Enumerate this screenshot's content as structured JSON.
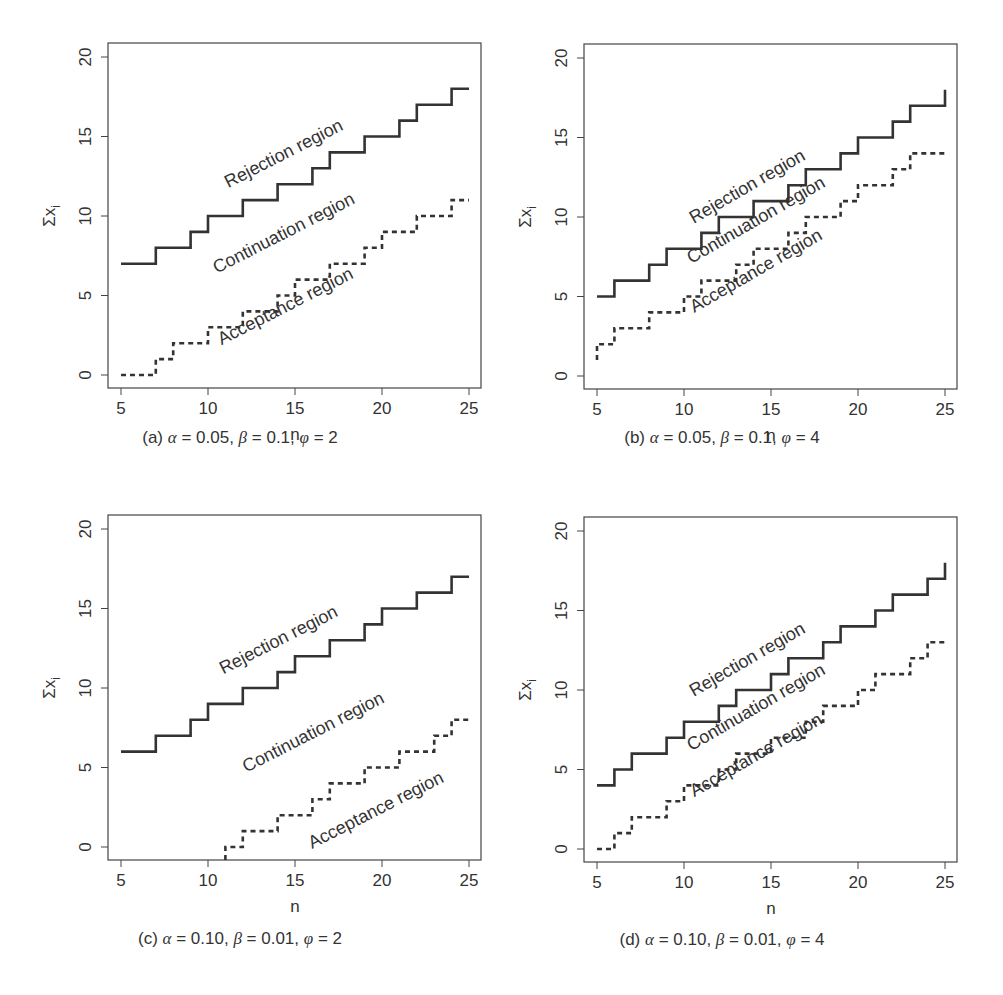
{
  "chart_data": [
    {
      "type": "line",
      "id": "a",
      "title": "",
      "caption": "(a) α = 0.05, β = 0.1, φ = 2",
      "xlabel": "n",
      "ylabel": "Σx_i",
      "xlim": [
        5,
        25
      ],
      "ylim": [
        0,
        20
      ],
      "xticks": [
        5,
        10,
        15,
        20,
        25
      ],
      "yticks": [
        0,
        5,
        10,
        15,
        20
      ],
      "grid": false,
      "annotations": [
        "Rejection region",
        "Continuation region",
        "Acceptance region"
      ],
      "x": [
        5,
        6,
        7,
        8,
        9,
        10,
        11,
        12,
        13,
        14,
        15,
        16,
        17,
        18,
        19,
        20,
        21,
        22,
        23,
        24,
        25
      ],
      "series": [
        {
          "name": "Rejection boundary",
          "style": "solid",
          "values": [
            7,
            7,
            8,
            8,
            9,
            10,
            10,
            11,
            11,
            12,
            12,
            13,
            14,
            14,
            15,
            15,
            16,
            17,
            17,
            18,
            18
          ]
        },
        {
          "name": "Acceptance boundary",
          "style": "dashed",
          "values": [
            0,
            0,
            1,
            2,
            2,
            3,
            3,
            4,
            4,
            5,
            6,
            6,
            7,
            7,
            8,
            9,
            9,
            10,
            10,
            11,
            11
          ]
        }
      ]
    },
    {
      "type": "line",
      "id": "b",
      "title": "",
      "caption": "(b) α = 0.05, β = 0.1, φ = 4",
      "xlabel": "n",
      "ylabel": "Σx_i",
      "xlim": [
        5,
        25
      ],
      "ylim": [
        0,
        20
      ],
      "xticks": [
        5,
        10,
        15,
        20,
        25
      ],
      "yticks": [
        0,
        5,
        10,
        15,
        20
      ],
      "grid": false,
      "annotations": [
        "Rejection region",
        "Continuation region",
        "Acceptance region"
      ],
      "x": [
        5,
        6,
        7,
        8,
        9,
        10,
        11,
        12,
        13,
        14,
        15,
        16,
        17,
        18,
        19,
        20,
        21,
        22,
        23,
        24,
        25
      ],
      "series": [
        {
          "name": "Rejection boundary",
          "style": "solid",
          "values": [
            5,
            6,
            6,
            7,
            8,
            8,
            9,
            10,
            10,
            11,
            11,
            12,
            13,
            13,
            14,
            15,
            15,
            16,
            17,
            17,
            18
          ]
        },
        {
          "name": "Acceptance boundary",
          "style": "dashed",
          "values": [
            2,
            3,
            3,
            4,
            4,
            5,
            6,
            6,
            7,
            8,
            8,
            9,
            10,
            10,
            11,
            12,
            12,
            13,
            14,
            14,
            14
          ]
        }
      ]
    },
    {
      "type": "line",
      "id": "c",
      "title": "",
      "caption": "(c) α = 0.10, β = 0.01, φ = 2",
      "xlabel": "n",
      "ylabel": "Σx_i",
      "xlim": [
        5,
        25
      ],
      "ylim": [
        0,
        20
      ],
      "xticks": [
        5,
        10,
        15,
        20,
        25
      ],
      "yticks": [
        0,
        5,
        10,
        15,
        20
      ],
      "grid": false,
      "annotations": [
        "Rejection region",
        "Continuation region",
        "Acceptance region"
      ],
      "x": [
        5,
        6,
        7,
        8,
        9,
        10,
        11,
        12,
        13,
        14,
        15,
        16,
        17,
        18,
        19,
        20,
        21,
        22,
        23,
        24,
        25
      ],
      "series": [
        {
          "name": "Rejection boundary",
          "style": "solid",
          "values": [
            6,
            6,
            7,
            7,
            8,
            9,
            9,
            10,
            10,
            11,
            12,
            12,
            13,
            13,
            14,
            15,
            15,
            16,
            16,
            17,
            17
          ]
        },
        {
          "name": "Acceptance boundary",
          "style": "dashed",
          "values": [
            null,
            null,
            null,
            null,
            null,
            null,
            0,
            1,
            1,
            2,
            2,
            3,
            4,
            4,
            5,
            5,
            6,
            6,
            7,
            8,
            8
          ]
        }
      ]
    },
    {
      "type": "line",
      "id": "d",
      "title": "",
      "caption": "(d) α = 0.10, β = 0.01, φ = 4",
      "xlabel": "n",
      "ylabel": "Σx_i",
      "xlim": [
        5,
        25
      ],
      "ylim": [
        0,
        20
      ],
      "xticks": [
        5,
        10,
        15,
        20,
        25
      ],
      "yticks": [
        0,
        5,
        10,
        15,
        20
      ],
      "grid": false,
      "annotations": [
        "Rejection region",
        "Continuation region",
        "Acceptance region"
      ],
      "x": [
        5,
        6,
        7,
        8,
        9,
        10,
        11,
        12,
        13,
        14,
        15,
        16,
        17,
        18,
        19,
        20,
        21,
        22,
        23,
        24,
        25
      ],
      "series": [
        {
          "name": "Rejection boundary",
          "style": "solid",
          "values": [
            4,
            5,
            6,
            6,
            7,
            8,
            8,
            9,
            10,
            10,
            11,
            12,
            12,
            13,
            14,
            14,
            15,
            16,
            16,
            17,
            18
          ]
        },
        {
          "name": "Acceptance boundary",
          "style": "dashed",
          "values": [
            0,
            1,
            2,
            2,
            3,
            4,
            4,
            5,
            6,
            6,
            7,
            7,
            8,
            9,
            9,
            10,
            11,
            11,
            12,
            13,
            13
          ]
        }
      ]
    }
  ],
  "panels": [
    {
      "caption_prefix": "(a)",
      "alpha": "0.05",
      "beta": "0.1",
      "phi": "2"
    },
    {
      "caption_prefix": "(b)",
      "alpha": "0.05",
      "beta": "0.1",
      "phi": "4"
    },
    {
      "caption_prefix": "(c)",
      "alpha": "0.10",
      "beta": "0.01",
      "phi": "2"
    },
    {
      "caption_prefix": "(d)",
      "alpha": "0.10",
      "beta": "0.01",
      "phi": "4"
    }
  ],
  "labels": {
    "rejection": "Rejection region",
    "continuation": "Continuation region",
    "acceptance": "Acceptance region",
    "xlabel": "n",
    "ylabel_sigma": "Σx",
    "ylabel_sub": "i",
    "alpha": "α",
    "beta": "β",
    "phi": "φ"
  }
}
